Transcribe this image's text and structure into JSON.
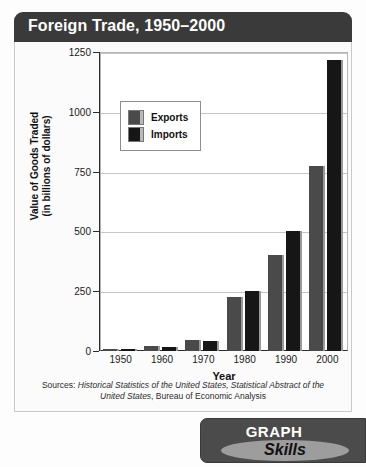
{
  "card": {
    "title": "Foreign Trade, 1950–2000"
  },
  "chart_data": {
    "type": "bar",
    "title": "Foreign Trade, 1950–2000",
    "xlabel": "Year",
    "ylabel": "Value of Goods Traded (in billions of dollars)",
    "ylabel_line1": "Value of Goods Traded",
    "ylabel_line2": "(in billions of dollars)",
    "categories": [
      "1950",
      "1960",
      "1970",
      "1980",
      "1990",
      "2000"
    ],
    "yticks": [
      "0",
      "250",
      "500",
      "750",
      "1000",
      "1250"
    ],
    "ylim": [
      0,
      1250
    ],
    "grid": true,
    "legend_position": "top-left-inside",
    "series": [
      {
        "name": "Exports",
        "color": "#4a4a4a",
        "values": [
          10,
          20,
          45,
          225,
          400,
          775
        ]
      },
      {
        "name": "Imports",
        "color": "#161616",
        "values": [
          9,
          15,
          42,
          250,
          500,
          1215
        ]
      }
    ]
  },
  "sources": {
    "prefix": "Sources: ",
    "italic1": "Historical Statistics of the United States, Statistical Abstract of the United States",
    "suffix": ", Bureau of Economic Analysis"
  },
  "badge": {
    "top_label": "GRAPH",
    "bottom_label": "Skills"
  }
}
